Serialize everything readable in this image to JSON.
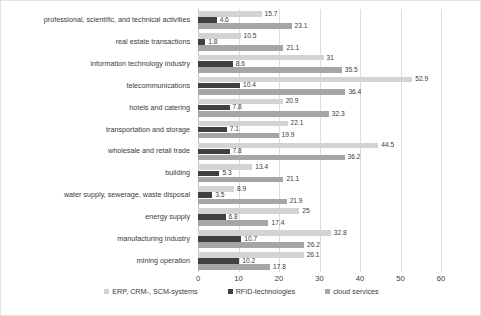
{
  "chart_data": {
    "type": "bar",
    "orientation": "horizontal",
    "title": "",
    "xlabel": "",
    "ylabel": "",
    "xlim": [
      0,
      60
    ],
    "xticks": [
      "0",
      "10",
      "20",
      "30",
      "40",
      "50",
      "60"
    ],
    "grid": true,
    "legend_position": "bottom",
    "categories": [
      "professional, scientific, and technical activities",
      "real estate transactions",
      "information technology industry",
      "telecommunications",
      "hotels and catering",
      "transportation and storage",
      "wholesale and retail trade",
      "building",
      "water supply, sewerage, waste disposal",
      "energy supply",
      "manufacturing industry",
      "mining operation"
    ],
    "series": [
      {
        "name": "ERP, CRM-, SCM-systems",
        "color": "#d3d3d3",
        "values": [
          15.7,
          10.5,
          31,
          52.9,
          20.9,
          22.1,
          44.5,
          13.4,
          8.9,
          25,
          32.8,
          26.1
        ],
        "labels": [
          "15.7",
          "10.5",
          "31",
          "52.9",
          "20.9",
          "22.1",
          "44.5",
          "13.4",
          "8.9",
          "25",
          "32.8",
          "26.1"
        ]
      },
      {
        "name": "RFID-technologies",
        "color": "#404040",
        "values": [
          4.6,
          1.8,
          8.6,
          10.4,
          7.8,
          7.1,
          7.8,
          5.3,
          3.5,
          6.8,
          10.7,
          10.2
        ],
        "labels": [
          "4.6",
          "1.8",
          "8.6",
          "10.4",
          "7.8",
          "7.1",
          "7.8",
          "5.3",
          "3.5",
          "6.8",
          "10.7",
          "10.2"
        ]
      },
      {
        "name": "cloud services",
        "color": "#a6a6a6",
        "values": [
          23.1,
          21.1,
          35.5,
          36.4,
          32.3,
          19.9,
          36.2,
          21.1,
          21.9,
          17.4,
          26.2,
          17.8
        ],
        "labels": [
          "23.1",
          "21.1",
          "35.5",
          "36.4",
          "32.3",
          "19.9",
          "36.2",
          "21.1",
          "21.9",
          "17.4",
          "26.2",
          "17.8"
        ]
      }
    ]
  }
}
